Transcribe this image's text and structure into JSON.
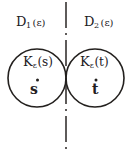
{
  "figure": {
    "width": 130,
    "height": 153,
    "background_color": "#ffffff",
    "ink_color": "#23201e"
  },
  "divider": {
    "name": "vertical-dash-dot-line",
    "orientation": "vertical",
    "style": "dash-dot",
    "x": 66,
    "y_start": 2,
    "y_end": 151,
    "color": "#2a2624"
  },
  "regions": [
    {
      "id": "D1",
      "label_base": "D",
      "label_subscript": "1",
      "label_argument": "(ε)",
      "label_full": "D₁(ε)",
      "side": "left"
    },
    {
      "id": "D2",
      "label_base": "D",
      "label_subscript": "2",
      "label_argument": "(ε)",
      "label_full": "D₂(ε)",
      "side": "right"
    }
  ],
  "circles": [
    {
      "id": "K-left",
      "label_base": "K",
      "label_subscript": "ε",
      "label_argument": "(s)",
      "label_full": "Kε(s)",
      "center_point": "ṡ",
      "cx": 37,
      "cy": 78,
      "r": 29,
      "side": "left"
    },
    {
      "id": "K-right",
      "label_base": "K",
      "label_subscript": "ε",
      "label_argument": "(t)",
      "label_full": "Kε(t)",
      "center_point": "ṫ",
      "cx": 95,
      "cy": 78,
      "r": 29,
      "side": "right"
    }
  ],
  "points": [
    {
      "id": "s-dot",
      "glyph": "ṡ",
      "base": "s",
      "accent": "dot-above"
    },
    {
      "id": "t-dot",
      "glyph": "ṫ",
      "base": "t",
      "accent": "dot-above"
    }
  ]
}
